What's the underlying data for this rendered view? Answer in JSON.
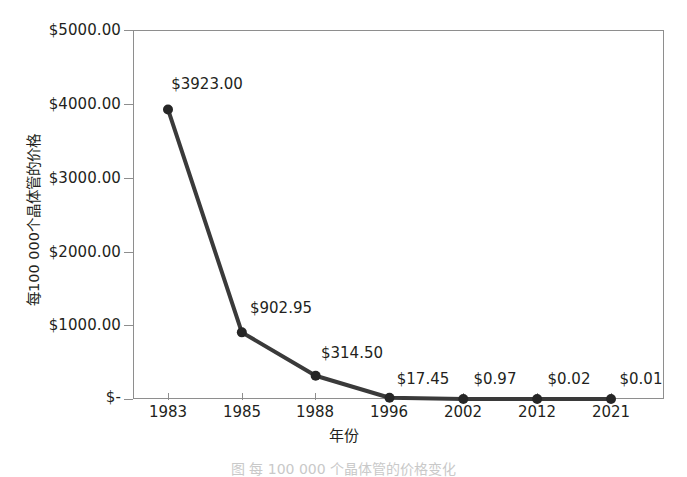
{
  "chart_data": {
    "type": "line",
    "title": "",
    "xlabel": "年份",
    "ylabel": "每100 000个晶体管的价格",
    "categories": [
      "1983",
      "1985",
      "1988",
      "1996",
      "2002",
      "2012",
      "2021"
    ],
    "values": [
      3923.0,
      902.95,
      314.5,
      17.45,
      0.97,
      0.02,
      0.01
    ],
    "point_labels": [
      "$3923.00",
      "$902.95",
      "$314.50",
      "$17.45",
      "$0.97",
      "$0.02",
      "$0.01"
    ],
    "ylim": [
      0,
      5000
    ],
    "y_ticks": [
      5000,
      4000,
      3000,
      2000,
      1000,
      0
    ],
    "y_tick_labels": [
      "$5000.00",
      "$4000.00",
      "$3000.00",
      "$2000.00",
      "$1000.00",
      "$-"
    ],
    "grid": false,
    "legend": "none",
    "series": [
      {
        "name": "每100 000个晶体管的价格",
        "values": [
          3923.0,
          902.95,
          314.5,
          17.45,
          0.97,
          0.02,
          0.01
        ]
      }
    ],
    "colors": {
      "line": "#3a3a3a",
      "marker": "#262626",
      "axis": "#8e8e8e",
      "text": "#231f20",
      "background": "#ffffff"
    }
  },
  "caption": {
    "text": "图 每 100 000 个晶体管的价格变化"
  }
}
